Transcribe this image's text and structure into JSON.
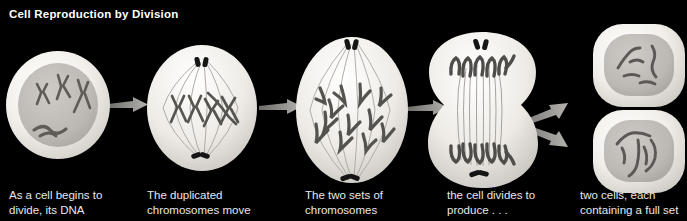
{
  "figure": {
    "title": "Cell Reproduction by Division",
    "background_color": "#000000",
    "title_color": "#ffffff",
    "caption_color": "#e8e8e8",
    "cell_body_color": "#efece7",
    "cell_interior_color": "#d8d5d0",
    "nucleus_color": "#b9b6b1",
    "chromosome_color": "#555350",
    "centriole_color": "#141414",
    "spindle_color": "#9a9792",
    "arrow_color": "#8f8d8a"
  },
  "stages": [
    {
      "id": "stage-1-interphase",
      "name": "interphase-cell",
      "caption_line1": "As a cell begins to",
      "caption_line2": "divide, its DNA",
      "shape": "round cell with circular nucleus",
      "chromosome_count": 4,
      "has_spindle": false,
      "has_centrioles": false
    },
    {
      "id": "stage-2-metaphase",
      "name": "metaphase-cell",
      "caption_line1": "The duplicated",
      "caption_line2": "chromosomes move",
      "shape": "oval cell with spindle apparatus",
      "chromosome_count": 6,
      "has_spindle": true,
      "has_centrioles": true
    },
    {
      "id": "stage-3-anaphase",
      "name": "anaphase-cell",
      "caption_line1": "The two sets of",
      "caption_line2": "chromosomes",
      "shape": "large oval cell, chromatids pulled apart",
      "chromosome_count": 12,
      "has_spindle": true,
      "has_centrioles": true
    },
    {
      "id": "stage-4-telophase",
      "name": "telophase-cytokinesis-cell",
      "caption_line1": "the cell divides to",
      "caption_line2": "produce . . .",
      "shape": "dumbbell cell with cleavage furrow",
      "chromosome_count": 12,
      "has_spindle": true,
      "has_centrioles": true
    },
    {
      "id": "stage-5-daughters",
      "name": "daughter-cells",
      "caption_line1": "two cells, each",
      "caption_line2": "containing a full set",
      "shape": "two rounded-square daughter cells",
      "chromosome_count": 6,
      "has_spindle": false,
      "has_centrioles": false
    }
  ],
  "arrows": [
    {
      "name": "arrow-stage1-to-stage2",
      "direction": "right"
    },
    {
      "name": "arrow-stage2-to-stage3",
      "direction": "right"
    },
    {
      "name": "arrow-stage3-to-stage4",
      "direction": "right"
    },
    {
      "name": "arrow-stage4-to-daughter-top",
      "direction": "up-right"
    },
    {
      "name": "arrow-stage4-to-daughter-bottom",
      "direction": "down-right"
    }
  ]
}
